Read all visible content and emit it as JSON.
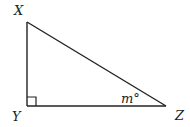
{
  "diagram": {
    "type": "right-triangle",
    "vertices": {
      "X": {
        "label": "X",
        "x": 27,
        "y": 22
      },
      "Y": {
        "label": "Y",
        "x": 27,
        "y": 106
      },
      "Z": {
        "label": "Z",
        "x": 166,
        "y": 106
      }
    },
    "right_angle_at": "Y",
    "angle_label": {
      "vertex": "Z",
      "text": "m°"
    },
    "colors": {
      "stroke": "#222222",
      "text": "#222222",
      "background": "#ffffff"
    }
  }
}
